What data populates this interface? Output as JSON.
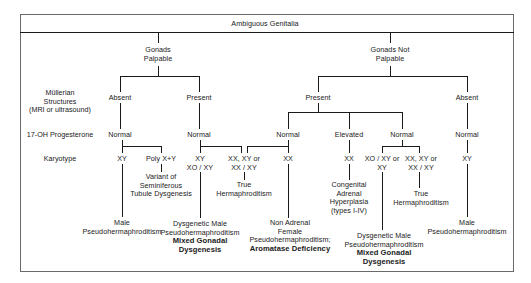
{
  "diagram": {
    "root": "Ambiguous Genitalia",
    "row_labels": {
      "mullerian": [
        "Müllerian",
        "Structures",
        "(MRI or ultrasound)"
      ],
      "progesterone": "17-OH Progesterone",
      "karyotype": "Karyotype"
    },
    "gonads_palpable": {
      "label": [
        "Gonads",
        "Palpable"
      ],
      "absent": {
        "mullerian": "Absent",
        "progesterone": "Normal",
        "karyotype_xy": "XY",
        "karyotype_poly": "Poly X+Y",
        "poly_result": [
          "Variant of",
          "Seminiferous",
          "Tubule Dysgenesis"
        ],
        "xy_result": [
          "Male",
          "Pseudohermaphroditism"
        ]
      },
      "present": {
        "mullerian": "Present",
        "progesterone": "Normal",
        "karyotype_a": [
          "XY",
          "XO / XY"
        ],
        "karyotype_b": [
          "XX, XY or",
          "XX / XY"
        ],
        "result_a": [
          "Dysgenetic Male",
          "Pseudohermaphroditism"
        ],
        "result_a_bold": [
          "Mixed Gonadal",
          "Dysgenesis"
        ],
        "result_b": [
          "True",
          "Hermaphroditism"
        ]
      }
    },
    "gonads_not_palpable": {
      "label": [
        "Gonads Not",
        "Palpable"
      ],
      "present": {
        "mullerian": "Present",
        "normal_1": {
          "progesterone": "Normal",
          "karyotype": "XX",
          "result": [
            "Non Adrenal",
            "Female",
            "Pseudohermaphroditism;"
          ],
          "result_bold": "Aromatase Deficiency"
        },
        "elevated": {
          "progesterone": "Elevated",
          "karyotype": "XX",
          "result": [
            "Congenital",
            "Adrenal",
            "Hyperplasia",
            "(types I-IV)"
          ]
        },
        "normal_2": {
          "progesterone": "Normal",
          "karyotype_a": [
            "XO / XY or",
            "XY"
          ],
          "karyotype_b": [
            "XX, XY or",
            "XX / XY"
          ],
          "result_a": [
            "Dysgenetic Male",
            "Pseudohermaphroditism"
          ],
          "result_a_bold": [
            "Mixed Gonadal",
            "Dysgenesis"
          ],
          "result_b": [
            "True",
            "Hermaphroditism"
          ]
        }
      },
      "absent": {
        "mullerian": "Absent",
        "progesterone": "Normal",
        "karyotype": "XY",
        "result": [
          "Male",
          "Pseudohermaphroditism"
        ]
      }
    }
  }
}
